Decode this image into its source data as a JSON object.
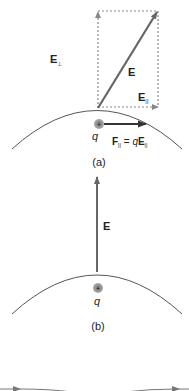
{
  "colors": {
    "vector": "#666666",
    "dashed": "#8a8a8a",
    "surface": "#555555",
    "charge_fill": "#9a9a9a",
    "text": "#222222"
  },
  "panel_a": {
    "caption": "(a)",
    "label_E": "E",
    "label_E_perp": "E",
    "label_E_perp_sub": "⊥",
    "label_E_par": "E",
    "label_E_par_sub": "||",
    "charge_label": "q",
    "charge_sign": "+",
    "force_label": "F",
    "force_sub": "||",
    "force_eq": " = ",
    "force_q": "q",
    "force_E": "E",
    "force_E_sub": "||"
  },
  "panel_b": {
    "caption": "(b)",
    "label_E": "E",
    "charge_label": "q",
    "charge_sign": "+"
  }
}
